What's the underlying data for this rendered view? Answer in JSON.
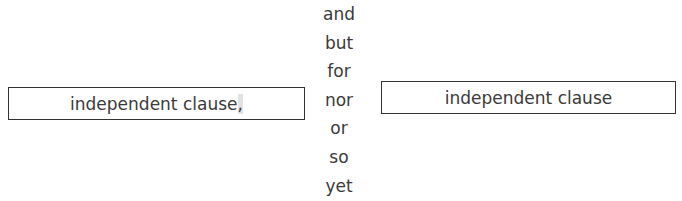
{
  "left_clause": {
    "text": "independent clause",
    "punctuation": ","
  },
  "right_clause": {
    "text": "independent clause"
  },
  "conjunctions": [
    "and",
    "but",
    "for",
    "nor",
    "or",
    "so",
    "yet"
  ]
}
